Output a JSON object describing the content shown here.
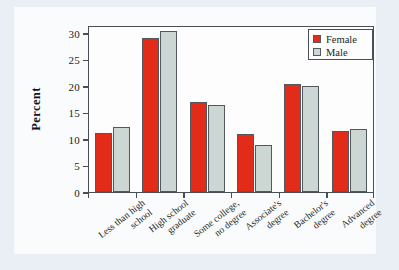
{
  "chart_data": {
    "type": "bar",
    "title": "",
    "subtitle": "",
    "xlabel": "",
    "ylabel": "Percent",
    "ylim": [
      0,
      31.5
    ],
    "yticks": [
      0,
      5,
      10,
      15,
      20,
      25,
      30
    ],
    "ytick_labels": [
      "0",
      "5",
      "10",
      "15",
      "20",
      "25",
      "30"
    ],
    "grid": false,
    "legend_position": "top-right",
    "categories": [
      "Less than high school",
      "High school graduate",
      "Some college, no degree",
      "Associate's degree",
      "Bachelor's degree",
      "Advanced degree"
    ],
    "category_lines": [
      [
        "Less than high",
        "school"
      ],
      [
        "High school",
        "graduate"
      ],
      [
        "Some college,",
        "no degree"
      ],
      [
        "Associate's",
        "degree"
      ],
      [
        "Bachelor's",
        "degree"
      ],
      [
        "Advanced",
        "degree"
      ]
    ],
    "series": [
      {
        "name": "Female",
        "color": "#e22b18",
        "values": [
          11.1,
          29.0,
          17.0,
          11.0,
          20.3,
          11.6
        ]
      },
      {
        "name": "Male",
        "color": "#ccd6d2",
        "values": [
          12.3,
          30.4,
          16.4,
          8.9,
          20.0,
          11.9
        ]
      }
    ]
  },
  "colors": {
    "female": "#e22b18",
    "male": "#ccd6d2",
    "axis": "#4a4f55",
    "text": "#1b1f22",
    "page_background": "#e9eff5",
    "card_background": "#fafbfc",
    "plot_background": "#fdfdfd"
  }
}
